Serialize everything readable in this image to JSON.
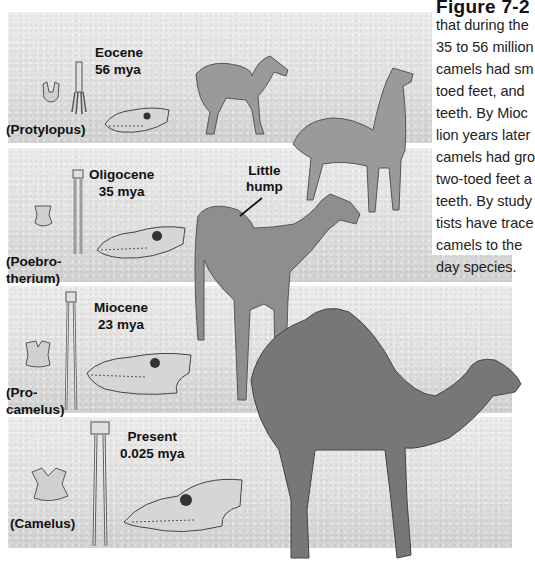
{
  "figure": {
    "title": "Figure 7-2",
    "caption_lines": [
      "that during the",
      "35 to 56 million",
      "camels had sm",
      "toed feet, and",
      "teeth. By Mioc",
      "lion years later",
      "camels had gro",
      "two-toed feet a",
      "teeth. By study",
      "tists have trace",
      "camels to the",
      "day species."
    ]
  },
  "eras": [
    {
      "name": "Eocene",
      "age": "56 mya",
      "genus": "(Protylopus)"
    },
    {
      "name": "Oligocene",
      "age": "35 mya",
      "genus_line1": "(Poebro-",
      "genus_line2": "therium)"
    },
    {
      "name": "Miocene",
      "age": "23 mya",
      "genus_line1": "(Pro-",
      "genus_line2": "camelus)"
    },
    {
      "name": "Present",
      "age": "0.025 mya",
      "genus": "(Camelus)"
    }
  ],
  "callout": {
    "line1": "Little",
    "line2": "hump"
  },
  "icons": {
    "tooth": "molar-tooth-illustration",
    "foot": "foot-bone-illustration",
    "skull": "skull-illustration",
    "animal": "camel-ancestor-illustration"
  },
  "colors": {
    "band": "#e2e2e2",
    "text": "#111111",
    "bone": "#d8d8d8",
    "animal": "#8a8a8a"
  }
}
